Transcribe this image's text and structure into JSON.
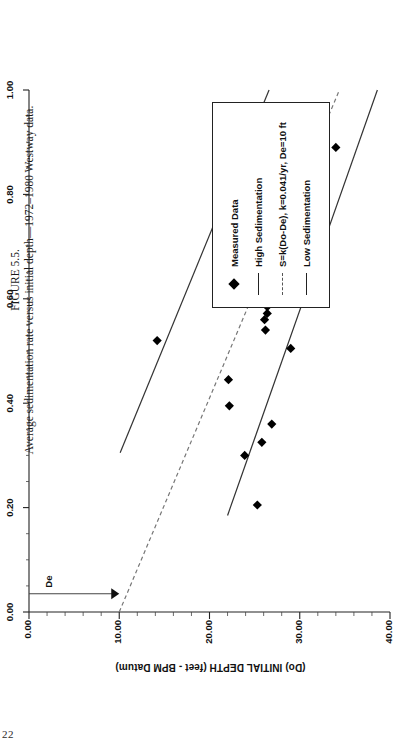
{
  "page": {
    "number": "22"
  },
  "caption": {
    "figure_number": "FIGURE 5.5.",
    "text": "Average sedimentation rate versus initial depth—1972–1980 Westway data."
  },
  "legend": {
    "items": [
      {
        "label": "Measured Data",
        "key": "diamond-marker-icon"
      },
      {
        "label": "High Sedimentation",
        "key": "solid-line-icon"
      },
      {
        "label": "S=k(Do-De),  k=0.041/yr, De=10 ft",
        "key": "dashed-line-icon"
      },
      {
        "label": "Low Sedimentation",
        "key": "solid-line-icon"
      }
    ]
  },
  "annotations": {
    "de_label": "De"
  },
  "chart_data": {
    "type": "scatter",
    "title": "",
    "orientation": "rotated-90-ccw",
    "xlabel": "SEDIMENTATION RATE (feet/year) (S)",
    "ylabel": "(Do)  INITIAL DEPTH (feet - BPM Datum)",
    "xlim": [
      0.0,
      1.0
    ],
    "ylim": [
      0.0,
      40.0
    ],
    "x_ticks": [
      0.0,
      0.2,
      0.4,
      0.6,
      0.8,
      1.0
    ],
    "x_tick_labels": [
      "0.00",
      "0.20",
      "0.40",
      "0.60",
      "0.80",
      "1.00"
    ],
    "y_ticks": [
      0.0,
      10.0,
      20.0,
      30.0,
      40.0
    ],
    "y_tick_labels": [
      "0.00",
      "10.00",
      "20.00",
      "30.00",
      "40.00"
    ],
    "x_minor_step": 0.05,
    "y_minor_step": 2.0,
    "grid": false,
    "legend_position": "below-plot",
    "series": [
      {
        "name": "Measured Data",
        "type": "scatter",
        "marker": "diamond",
        "color": "#000000",
        "points": [
          [
            0.205,
            25.3
          ],
          [
            0.3,
            23.9
          ],
          [
            0.325,
            25.8
          ],
          [
            0.36,
            26.9
          ],
          [
            0.395,
            22.2
          ],
          [
            0.445,
            22.1
          ],
          [
            0.505,
            29.0
          ],
          [
            0.52,
            14.2
          ],
          [
            0.54,
            26.2
          ],
          [
            0.56,
            26.1
          ],
          [
            0.572,
            26.4
          ],
          [
            0.585,
            26.4
          ],
          [
            0.6,
            26.5
          ],
          [
            0.625,
            26.8
          ],
          [
            0.64,
            26.9
          ],
          [
            0.648,
            26.1
          ],
          [
            0.66,
            28.3
          ],
          [
            0.69,
            26.3
          ],
          [
            0.7,
            30.0
          ],
          [
            0.71,
            21.2
          ],
          [
            0.79,
            22.0
          ],
          [
            0.845,
            26.1
          ],
          [
            0.895,
            29.3
          ],
          [
            0.905,
            26.1
          ],
          [
            0.89,
            34.0
          ]
        ]
      },
      {
        "name": "High Sedimentation",
        "type": "line",
        "style": "solid",
        "color": "#333333",
        "points": [
          [
            0.305,
            10.1
          ],
          [
            1.0,
            26.6
          ]
        ]
      },
      {
        "name": "S=k(Do-De),  k=0.041/yr, De=10 ft",
        "type": "line",
        "style": "dashed",
        "color": "#777777",
        "points": [
          [
            0.0,
            10.0
          ],
          [
            1.0,
            34.4
          ]
        ]
      },
      {
        "name": "Low Sedimentation",
        "type": "line",
        "style": "solid",
        "color": "#333333",
        "points": [
          [
            0.185,
            22.0
          ],
          [
            1.0,
            38.6
          ]
        ]
      }
    ],
    "de_arrow": {
      "x": 0.035,
      "y_from": 0.0,
      "y_to": 10.0,
      "label": "De"
    }
  }
}
